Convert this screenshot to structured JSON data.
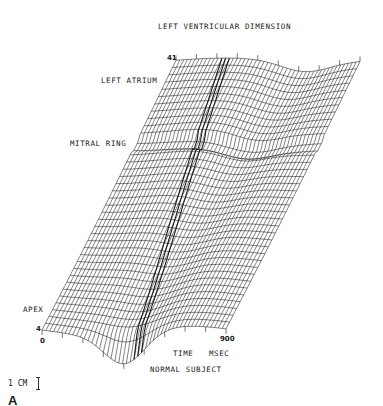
{
  "chart_data": {
    "type": "surface-3d-wireframe",
    "title": "LEFT VENTRICULAR DIMENSION",
    "caption": "NORMAL SUBJECT",
    "panel_label": "A",
    "x_axis": {
      "label": "TIME MSEC",
      "ticks": [
        "0",
        "900"
      ],
      "range": [
        0,
        900
      ],
      "unit": "msec"
    },
    "y_axis": {
      "label": "",
      "ticks": [
        "4",
        "41"
      ],
      "range": [
        4,
        41
      ],
      "description": "position along ventricle from apex to left atrium"
    },
    "z_axis": {
      "label": "LEFT VENTRICULAR DIMENSION",
      "scale_bar": "1 CM"
    },
    "annotations": [
      "LEFT ATRIUM",
      "MITRAL RING",
      "APEX"
    ],
    "grid": true,
    "mesh": {
      "rows": 38,
      "cols": 48
    },
    "line_color": "#1a1a1a",
    "background": "#ffffff"
  },
  "labels": {
    "title": "LEFT VENTRICULAR DIMENSION",
    "left_atrium": "LEFT ATRIUM",
    "mitral_ring": "MITRAL RING",
    "apex": "APEX",
    "y_top": "41",
    "y_bottom": "4",
    "x_start": "0",
    "x_end": "900",
    "x_label": "TIME",
    "x_unit": "MSEC",
    "caption": "NORMAL SUBJECT",
    "scale_bar": "1 CM",
    "panel": "A"
  }
}
